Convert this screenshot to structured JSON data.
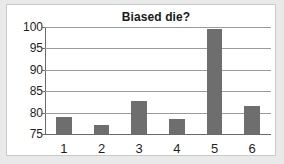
{
  "chart_data": {
    "type": "bar",
    "title": "Biased die?",
    "xlabel": "",
    "ylabel": "",
    "categories": [
      "1",
      "2",
      "3",
      "4",
      "5",
      "6"
    ],
    "values": [
      79.0,
      77.0,
      82.7,
      78.6,
      99.5,
      81.5
    ],
    "ylim": [
      75,
      100
    ],
    "yticks": [
      75,
      80,
      85,
      90,
      95,
      100
    ],
    "ytick_labels": [
      "75",
      "80",
      "85",
      "90",
      "95",
      "100"
    ],
    "grid": true,
    "legend": null,
    "colors": {
      "bar": "#6e6e6e",
      "gridline": "#9a9a9a",
      "axis": "#6a6a6a",
      "plot_background": "#ffffff",
      "page_background": "#e9e9e9",
      "frame_border": "#c9c9c9",
      "text": "#1f1f1f"
    }
  }
}
